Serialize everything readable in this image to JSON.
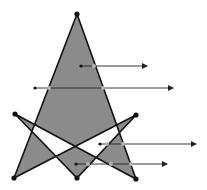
{
  "diagram": {
    "title": "",
    "colors": {
      "fill": "#8c8c8c",
      "stroke": "#111111",
      "vertex": "#111111",
      "ray": "#222222",
      "intersection": "#b4b4b4",
      "background": "#ffffff"
    },
    "polygon": {
      "vertices": [
        {
          "name": "top-apex",
          "x": 77,
          "y": 14
        },
        {
          "name": "bottom-right",
          "x": 136,
          "y": 179
        },
        {
          "name": "left-arm",
          "x": 15,
          "y": 114
        },
        {
          "name": "bottom-mid",
          "x": 77,
          "y": 178
        },
        {
          "name": "right-arm",
          "x": 136,
          "y": 115
        },
        {
          "name": "bottom-left",
          "x": 14,
          "y": 178
        }
      ]
    },
    "rays": [
      {
        "start": {
          "x": 81,
          "y": 66
        },
        "end": {
          "x": 147,
          "y": 66
        },
        "hits": [
          {
            "x": 94,
            "y": 66
          }
        ]
      },
      {
        "start": {
          "x": 35,
          "y": 88
        },
        "end": {
          "x": 173,
          "y": 88
        },
        "hits": [
          {
            "x": 49,
            "y": 88
          },
          {
            "x": 103,
            "y": 88
          }
        ]
      },
      {
        "start": {
          "x": 100,
          "y": 144
        },
        "end": {
          "x": 196,
          "y": 144
        },
        "hits": [
          {
            "x": 107,
            "y": 144
          },
          {
            "x": 123,
            "y": 144
          }
        ]
      },
      {
        "start": {
          "x": 76,
          "y": 164
        },
        "end": {
          "x": 167,
          "y": 164
        },
        "hits": [
          {
            "x": 88,
            "y": 164
          },
          {
            "x": 111,
            "y": 164
          },
          {
            "x": 131,
            "y": 164
          }
        ]
      }
    ]
  }
}
